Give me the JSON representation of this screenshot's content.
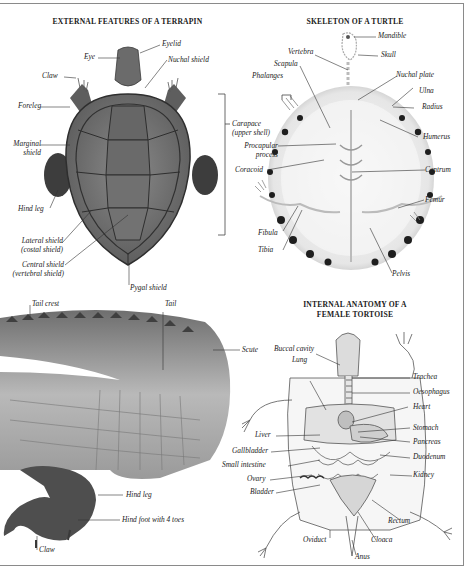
{
  "sections": {
    "terrapin": {
      "title": "EXTERNAL FEATURES OF A TERRAPIN",
      "labels": {
        "eye": "Eye",
        "eyelid": "Eyelid",
        "nuchal_shield": "Nuchal shield",
        "claw": "Claw",
        "foreleg": "Foreleg",
        "marginal_shield_1": "Marginal",
        "marginal_shield_2": "shield",
        "hind_leg": "Hind leg",
        "lateral_shield_1": "Lateral shield",
        "lateral_shield_2": "(costal shield)",
        "central_shield_1": "Central shield",
        "central_shield_2": "(vertebral shield)",
        "pygal_shield": "Pygal shield",
        "carapace_1": "Carapace",
        "carapace_2": "(upper shell)"
      }
    },
    "skeleton": {
      "title": "SKELETON OF A TURTLE",
      "labels": {
        "mandible": "Mandible",
        "skull": "Skull",
        "vertebra": "Vertebra",
        "scapula": "Scapula",
        "phalanges": "Phalanges",
        "nuchal_plate": "Nuchal plate",
        "ulna": "Ulna",
        "radius": "Radius",
        "humerus": "Humerus",
        "procapular_1": "Procapular",
        "procapular_2": "process",
        "coracoid": "Coracoid",
        "centrum": "Centrum",
        "femur": "Femur",
        "fibula": "Fibula",
        "tibia": "Tibia",
        "pelvis": "Pelvis"
      }
    },
    "crocodile": {
      "labels": {
        "tail_crest": "Tail crest",
        "tail": "Tail",
        "scute": "Scute",
        "hind_leg": "Hind leg",
        "hind_foot": "Hind foot with 4 toes",
        "claw": "Claw"
      }
    },
    "tortoise": {
      "title_1": "INTERNAL ANATOMY OF A",
      "title_2": "FEMALE TORTOISE",
      "labels": {
        "buccal_cavity": "Buccal cavity",
        "lung": "Lung",
        "trachea": "Trachea",
        "oesophagus": "Oesophagus",
        "heart": "Heart",
        "stomach": "Stomach",
        "liver": "Liver",
        "pancreas": "Pancreas",
        "gallbladder": "Gallbladder",
        "duodenum": "Duodenum",
        "small_intestine": "Small intestine",
        "kidney": "Kidney",
        "ovary": "Ovary",
        "bladder": "Bladder",
        "rectum": "Rectum",
        "oviduct": "Oviduct",
        "cloaca": "Cloaca",
        "anus": "Anus"
      }
    }
  },
  "colors": {
    "frame": "#8a8a8a",
    "shell_dark": "#4a4a4a",
    "shell_mid": "#777777",
    "bone": "#ececec",
    "bone_spot": "#1e1e1e",
    "organ_fill": "#d6d6d6"
  }
}
